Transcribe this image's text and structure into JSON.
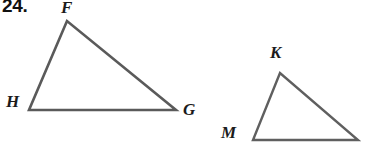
{
  "page": {
    "width": 373,
    "height": 160,
    "background_color": "#ffffff",
    "stroke_color": "#5a5a5a",
    "label_color": "#1b1b1b"
  },
  "problem": {
    "number_label": "24."
  },
  "figures": [
    {
      "name": "triangle-FHG",
      "vertices": [
        {
          "label": "F",
          "x": 67,
          "y": 21
        },
        {
          "label": "H",
          "x": 29,
          "y": 110
        },
        {
          "label": "G",
          "x": 176,
          "y": 110
        }
      ],
      "stroke_width": 2.6
    },
    {
      "name": "triangle-KM",
      "vertices": [
        {
          "label": "K",
          "x": 280,
          "y": 73
        },
        {
          "label": "M",
          "x": 253,
          "y": 140
        },
        {
          "label": "",
          "x": 358,
          "y": 140
        }
      ],
      "stroke_width": 2.4
    }
  ],
  "labels": {
    "F": "F",
    "H": "H",
    "G": "G",
    "K": "K",
    "M": "M"
  }
}
